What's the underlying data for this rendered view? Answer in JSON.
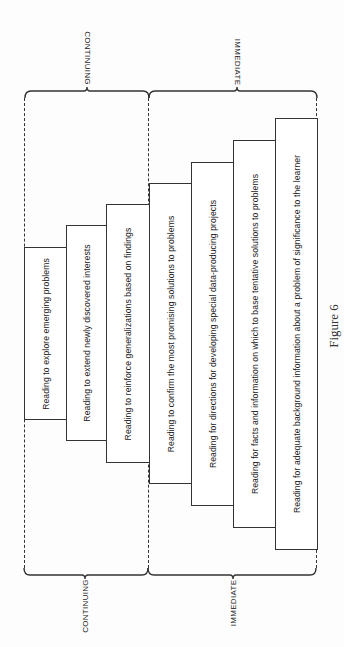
{
  "figure": {
    "caption": "Figure 6",
    "top_labels": [
      {
        "text": "CONTINUING",
        "x": 87,
        "y": 58
      },
      {
        "text": "IMMEDIATE",
        "x": 237,
        "y": 62
      }
    ],
    "bottom_labels": [
      {
        "text": "CONTINUING",
        "x": 85,
        "y": 606
      },
      {
        "text": "IMMEDIATE",
        "x": 233,
        "y": 603
      }
    ],
    "groups": [
      {
        "name": "Continuing",
        "boxes": [
          0,
          1,
          2
        ]
      },
      {
        "name": "Immediate",
        "boxes": [
          3,
          4,
          5,
          6
        ]
      }
    ],
    "boxes": [
      {
        "text": "Reading to explore emerging problems",
        "left": 24,
        "right": 66,
        "top": 247,
        "bottom": 419
      },
      {
        "text": "Reading to extend newly discovered interests",
        "left": 66,
        "right": 106,
        "top": 225,
        "bottom": 440
      },
      {
        "text": "Reading to reinforce generalizations based on findings",
        "left": 106,
        "right": 149,
        "top": 204,
        "bottom": 462
      },
      {
        "text": "Reading to confirm the most promising solutions to problems",
        "left": 149,
        "right": 191,
        "top": 183,
        "bottom": 483
      },
      {
        "text": "Reading for directions for developing special data-producing projects",
        "left": 191,
        "right": 233,
        "top": 162,
        "bottom": 505
      },
      {
        "text": "Reading for facts and information on which to base tentative solutions to problems",
        "left": 233,
        "right": 275,
        "top": 140,
        "bottom": 527
      },
      {
        "text": "Reading for adequate background information about a problem of significance to the learner",
        "left": 275,
        "right": 317,
        "top": 118,
        "bottom": 549
      }
    ],
    "colors": {
      "line": "#333333",
      "text": "#222222",
      "background": "#fdfdfd"
    }
  }
}
